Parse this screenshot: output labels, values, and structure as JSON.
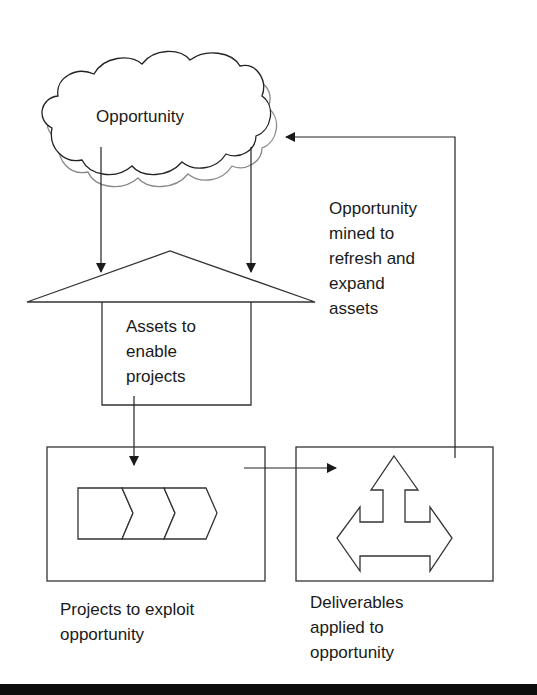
{
  "diagram": {
    "nodes": {
      "opportunity": {
        "label": "Opportunity",
        "shape": "cloud"
      },
      "assets": {
        "label": "Assets to\nenable\nprojects",
        "shape": "house"
      },
      "projects": {
        "label": "Projects to exploit\nopportunity",
        "shape": "box-with-chevrons"
      },
      "deliverables": {
        "label": "Deliverables\napplied to\nopportunity",
        "shape": "box-with-three-way-arrow"
      }
    },
    "edges": [
      {
        "from": "opportunity",
        "to": "assets",
        "label": ""
      },
      {
        "from": "opportunity",
        "to": "assets",
        "label": ""
      },
      {
        "from": "assets",
        "to": "projects",
        "label": ""
      },
      {
        "from": "projects",
        "to": "deliverables",
        "label": ""
      },
      {
        "from": "deliverables",
        "to": "opportunity",
        "label": "Opportunity\nmined to\nrefresh and\nexpand\nassets"
      }
    ],
    "colors": {
      "stroke": "#333333",
      "text": "#1a1a1a",
      "background": "#ffffff",
      "bar": "#0d0d0d"
    }
  }
}
